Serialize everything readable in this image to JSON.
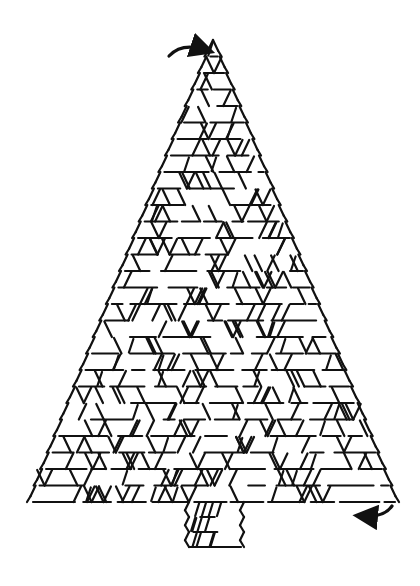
{
  "puzzle": {
    "shape": "christmas-tree",
    "type": "maze",
    "colors": {
      "ink": "#111111",
      "background": "#ffffff"
    },
    "canvas": {
      "width": 420,
      "height": 586
    },
    "tree": {
      "apex": {
        "x": 213,
        "y": 40
      },
      "base_left": {
        "x": 28,
        "y": 502
      },
      "base_right": {
        "x": 396,
        "y": 502
      },
      "row_count": 28,
      "stroke_width": 2.2
    },
    "trunk": {
      "x_left": 186,
      "x_right": 243,
      "y_top": 502,
      "y_bottom": 547,
      "row_count": 3
    },
    "entry_arrow": {
      "from": {
        "x": 169,
        "y": 56
      },
      "control": {
        "x": 182,
        "y": 42
      },
      "to": {
        "x": 206,
        "y": 50
      },
      "label": "start"
    },
    "exit_arrow": {
      "from": {
        "x": 392,
        "y": 506
      },
      "control": {
        "x": 384,
        "y": 518
      },
      "to": {
        "x": 362,
        "y": 516
      },
      "label": "finish"
    },
    "seed": 1225
  }
}
